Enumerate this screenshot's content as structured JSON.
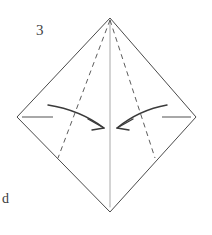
{
  "figure": {
    "background_color": "#ffffff",
    "width": 212,
    "height": 235,
    "step_number": "3",
    "panel_letter": "d",
    "colors": {
      "outline": "#4a4a4a",
      "dashed_fold": "#5c5c5c",
      "center_crease": "#a8a8a8",
      "edge_tick": "#a8a8a8",
      "arrow": "#3a3a3a",
      "label_text": "#3c3c3c"
    },
    "shape": {
      "name": "kite",
      "stroke_width": 1,
      "vertices": [
        {
          "name": "top-vertex",
          "x": 110,
          "y": 18
        },
        {
          "name": "right-vertex",
          "x": 196,
          "y": 117
        },
        {
          "name": "bottom-vertex",
          "x": 110,
          "y": 212
        },
        {
          "name": "left-vertex",
          "x": 17,
          "y": 117
        }
      ],
      "path": "M 110 18 L 196 117 L 110 212 L 17 117 Z"
    },
    "center_crease": {
      "name": "vertical-center-crease",
      "x1": 110,
      "y1": 20,
      "x2": 110,
      "y2": 207,
      "stroke_width": 1
    },
    "dashed_folds": [
      {
        "name": "left-dashed-fold-line",
        "x1": 110,
        "y1": 20,
        "x2": 58,
        "y2": 158,
        "dash_pattern": "5 4",
        "stroke_width": 1
      },
      {
        "name": "right-dashed-fold-line",
        "x1": 110,
        "y1": 20,
        "x2": 155,
        "y2": 158,
        "dash_pattern": "5 4",
        "stroke_width": 1
      }
    ],
    "edge_ticks": [
      {
        "name": "left-edge-tick",
        "x1": 22,
        "y1": 117,
        "x2": 53,
        "y2": 117,
        "stroke_width": 2
      },
      {
        "name": "right-edge-tick",
        "x1": 162,
        "y1": 117,
        "x2": 191,
        "y2": 117,
        "stroke_width": 2
      }
    ],
    "arrows": [
      {
        "name": "left-fold-arrow",
        "direction": "rightward",
        "curve_path": "M 48 105 Q 80 110 104 128",
        "head_path": "M 104 128 L 88 119 M 104 128 L 92 130",
        "stroke_width": 1.4
      },
      {
        "name": "right-fold-arrow",
        "direction": "leftward",
        "curve_path": "M 167 105 Q 139 110 117 128",
        "head_path": "M 117 128 L 133 119 M 117 128 L 129 130",
        "stroke_width": 1.4
      }
    ]
  }
}
